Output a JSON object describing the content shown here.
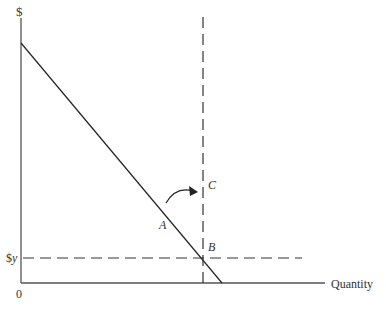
{
  "diagram": {
    "y_axis_label": "$",
    "x_axis_label": "Quantity",
    "origin_label": "0",
    "price_label_prefix": "$",
    "price_label_var": "y",
    "points": {
      "A": "A",
      "B": "B",
      "C": "C"
    },
    "colors": {
      "axis": "#444444",
      "line": "#222222",
      "dashed": "#333333",
      "text": "#333333"
    }
  }
}
